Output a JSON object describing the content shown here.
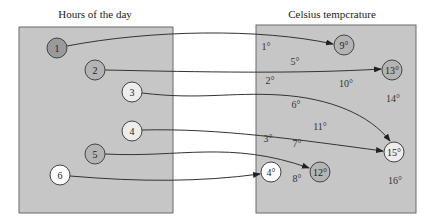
{
  "left_panel": {
    "title": "Hours of the day",
    "nodes": [
      {
        "label": "1",
        "x": 57,
        "y": 48,
        "fill": "#9a9a9a"
      },
      {
        "label": "2",
        "x": 95,
        "y": 70,
        "fill": "#b4b4b4"
      },
      {
        "label": "3",
        "x": 132,
        "y": 92,
        "fill": "#ededed"
      },
      {
        "label": "4",
        "x": 132,
        "y": 131,
        "fill": "#ededed"
      },
      {
        "label": "5",
        "x": 95,
        "y": 154,
        "fill": "#b4b4b4"
      },
      {
        "label": "6",
        "x": 60,
        "y": 175,
        "fill": "#ffffff"
      }
    ]
  },
  "right_panel": {
    "title": "Celsius tempcrature",
    "target_nodes": [
      {
        "label": "9°",
        "x": 344,
        "y": 45,
        "fill": "#b4b4b4"
      },
      {
        "label": "13°",
        "x": 392,
        "y": 70,
        "fill": "#b4b4b4"
      },
      {
        "label": "15°",
        "x": 394,
        "y": 152,
        "fill": "#ededed"
      },
      {
        "label": "12°",
        "x": 320,
        "y": 172,
        "fill": "#b4b4b4"
      },
      {
        "label": "4°",
        "x": 271,
        "y": 172,
        "fill": "#ffffff"
      }
    ],
    "values": [
      {
        "label": "1°",
        "x": 266,
        "y": 50
      },
      {
        "label": "5°",
        "x": 295,
        "y": 65
      },
      {
        "label": "2°",
        "x": 270,
        "y": 84
      },
      {
        "label": "10°",
        "x": 346,
        "y": 87
      },
      {
        "label": "14°",
        "x": 393,
        "y": 102
      },
      {
        "label": "6°",
        "x": 296,
        "y": 108
      },
      {
        "label": "11°",
        "x": 320,
        "y": 130
      },
      {
        "label": "3°",
        "x": 268,
        "y": 142
      },
      {
        "label": "7°",
        "x": 297,
        "y": 147
      },
      {
        "label": "8°",
        "x": 297,
        "y": 182
      },
      {
        "label": "16°",
        "x": 395,
        "y": 184
      }
    ]
  },
  "mappings": [
    {
      "from": "1",
      "to": "9°"
    },
    {
      "from": "2",
      "to": "13°"
    },
    {
      "from": "3",
      "to": "15°"
    },
    {
      "from": "4",
      "to": "15°"
    },
    {
      "from": "5",
      "to": "12°"
    },
    {
      "from": "6",
      "to": "4°"
    }
  ],
  "colors": {
    "panel_fill": "#c6c6c6",
    "panel_stroke": "#6a6a6a",
    "arrow": "#333333"
  }
}
